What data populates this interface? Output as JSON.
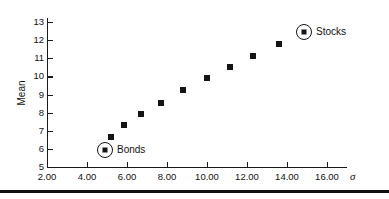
{
  "chart_data": {
    "type": "scatter",
    "title": "",
    "subtitle": "",
    "xlabel": "σ",
    "ylabel": "Mean",
    "xlim": [
      2.0,
      17.0
    ],
    "ylim": [
      5,
      13
    ],
    "grid": false,
    "legend_position": "inline-annotations",
    "x_ticks": [
      "2.00",
      "4.00",
      "6.00",
      "8.00",
      "10.00",
      "12.00",
      "14.00",
      "16.00"
    ],
    "x_tick_values": [
      2.0,
      4.0,
      6.0,
      8.0,
      10.0,
      12.0,
      14.0,
      16.0
    ],
    "y_ticks": [
      "5",
      "6",
      "7",
      "8",
      "9",
      "10",
      "11",
      "12",
      "13"
    ],
    "y_tick_values": [
      5,
      6,
      7,
      8,
      9,
      10,
      11,
      12,
      13
    ],
    "series": [
      {
        "name": "Efficient frontier portfolios",
        "x": [
          4.85,
          5.2,
          5.85,
          6.7,
          7.7,
          8.8,
          10.0,
          11.15,
          12.3,
          13.6
        ],
        "y": [
          6.0,
          6.65,
          7.3,
          7.95,
          8.55,
          9.25,
          9.9,
          10.5,
          11.15,
          11.8
        ]
      }
    ],
    "annotations": [
      {
        "label": "Bonds",
        "x": 4.85,
        "y": 6.0,
        "marker": "circled-square"
      },
      {
        "label": "Stocks",
        "x": 14.8,
        "y": 12.5,
        "marker": "circled-square"
      }
    ],
    "colors": {
      "marker": "#141414",
      "axis": "#1a1a1a",
      "text": "#111111",
      "background": "#ffffff",
      "rule": "#111111"
    }
  }
}
